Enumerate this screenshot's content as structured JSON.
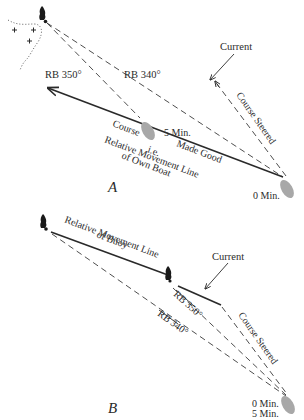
{
  "panel_a": {
    "letter": "A",
    "labels": {
      "rb_350": "RB 350°",
      "rb_340": "RB 340°",
      "current": "Current",
      "course_steered": "Course Steered",
      "five_min": "5 Min.",
      "zero_min": "0 Min.",
      "course": "Course",
      "made_good": "Made Good",
      "ie": "i.e.",
      "relative_movement_line": "Relative Movement Line",
      "of_own_boat": "of Own Boat"
    }
  },
  "panel_b": {
    "letter": "B",
    "labels": {
      "relative_movement_line": "Relative Movement Line",
      "of_buoy": "of Buoy",
      "current": "Current",
      "rb_350": "RB 350°",
      "rb_340": "RB 340°",
      "course_steered": "Course Steered",
      "zero_min": "0 Min.",
      "five_min": "5 Min."
    }
  },
  "colors": {
    "line": "#2a2a2a",
    "boat": "#a8a8a8",
    "buoy": "#1a1a1a",
    "background": "#ffffff"
  }
}
